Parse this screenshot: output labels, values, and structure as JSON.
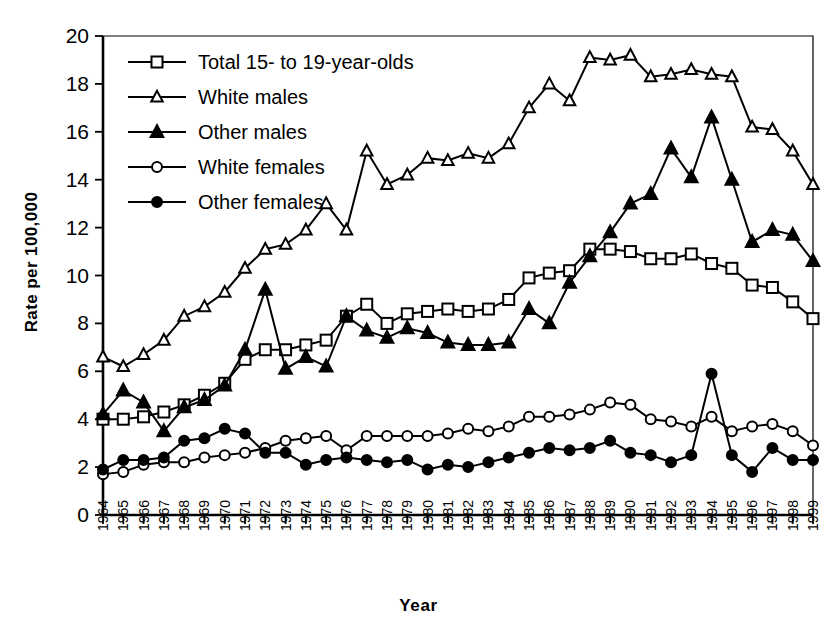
{
  "chart_data": {
    "type": "line",
    "title": "",
    "xlabel": "Year",
    "ylabel": "Rate per 100,000",
    "ylim": [
      0,
      20
    ],
    "ytick_step": 2,
    "yticks": [
      0,
      2,
      4,
      6,
      8,
      10,
      12,
      14,
      16,
      18,
      20
    ],
    "grid": false,
    "legend_position": "top-left inside plot",
    "categories": [
      "1964",
      "1965",
      "1966",
      "1967",
      "1968",
      "1969",
      "1970",
      "1971",
      "1972",
      "1973",
      "1974",
      "1975",
      "1976",
      "1977",
      "1978",
      "1979",
      "1980",
      "1981",
      "1982",
      "1983",
      "1984",
      "1985",
      "1986",
      "1987",
      "1988",
      "1989",
      "1990",
      "1991",
      "1992",
      "1993",
      "1994",
      "1995",
      "1996",
      "1997",
      "1998",
      "1999"
    ],
    "series": [
      {
        "name": "Total 15- to 19-year-olds",
        "marker": "open-square",
        "values": [
          4.0,
          4.0,
          4.1,
          4.3,
          4.6,
          5.0,
          5.5,
          6.5,
          6.9,
          6.9,
          7.1,
          7.3,
          8.3,
          8.8,
          8.0,
          8.4,
          8.5,
          8.6,
          8.5,
          8.6,
          9.0,
          9.9,
          10.1,
          10.2,
          11.1,
          11.1,
          11.0,
          10.7,
          10.7,
          10.9,
          10.5,
          10.3,
          9.6,
          9.5,
          8.9,
          8.2
        ]
      },
      {
        "name": "White males",
        "marker": "open-triangle",
        "values": [
          6.6,
          6.2,
          6.7,
          7.3,
          8.3,
          8.7,
          9.3,
          10.3,
          11.1,
          11.3,
          11.9,
          13.0,
          11.9,
          15.2,
          13.8,
          14.2,
          14.9,
          14.8,
          15.1,
          14.9,
          15.5,
          17.0,
          18.0,
          17.3,
          19.1,
          19.0,
          19.2,
          18.3,
          18.4,
          18.6,
          18.4,
          18.3,
          16.2,
          16.1,
          15.2,
          13.8
        ]
      },
      {
        "name": "Other males",
        "marker": "filled-triangle",
        "values": [
          4.2,
          5.2,
          4.7,
          3.5,
          4.5,
          4.8,
          5.4,
          6.9,
          9.4,
          6.1,
          6.6,
          6.2,
          8.3,
          7.7,
          7.4,
          7.8,
          7.6,
          7.2,
          7.1,
          7.1,
          7.2,
          8.6,
          8.0,
          9.7,
          10.8,
          11.8,
          13.0,
          13.4,
          15.3,
          14.1,
          16.6,
          14.0,
          11.4,
          11.9,
          11.7,
          10.6
        ]
      },
      {
        "name": "White females",
        "marker": "open-circle",
        "values": [
          1.7,
          1.8,
          2.1,
          2.2,
          2.2,
          2.4,
          2.5,
          2.6,
          2.8,
          3.1,
          3.2,
          3.3,
          2.7,
          3.3,
          3.3,
          3.3,
          3.3,
          3.4,
          3.6,
          3.5,
          3.7,
          4.1,
          4.1,
          4.2,
          4.4,
          4.7,
          4.6,
          4.0,
          3.9,
          3.7,
          4.1,
          3.5,
          3.7,
          3.8,
          3.5,
          2.9
        ]
      },
      {
        "name": "Other females",
        "marker": "filled-circle",
        "values": [
          1.9,
          2.3,
          2.3,
          2.4,
          3.1,
          3.2,
          3.6,
          3.4,
          2.6,
          2.6,
          2.1,
          2.3,
          2.4,
          2.3,
          2.2,
          2.3,
          1.9,
          2.1,
          2.0,
          2.2,
          2.4,
          2.6,
          2.8,
          2.7,
          2.8,
          3.1,
          2.6,
          2.5,
          2.2,
          2.5,
          5.9,
          2.5,
          1.8,
          2.8,
          2.3,
          2.3
        ]
      }
    ]
  },
  "legend": {
    "entries": [
      {
        "label": "Total 15- to 19-year-olds",
        "marker": "open-square"
      },
      {
        "label": "White males",
        "marker": "open-triangle"
      },
      {
        "label": "Other males",
        "marker": "filled-triangle"
      },
      {
        "label": "White females",
        "marker": "open-circle"
      },
      {
        "label": "Other females",
        "marker": "filled-circle"
      }
    ]
  },
  "colors": {
    "ink": "#000000",
    "background": "#ffffff"
  }
}
